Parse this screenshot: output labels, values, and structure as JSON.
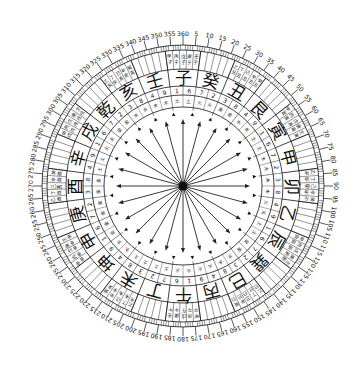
{
  "diagram": {
    "center": [
      183,
      186
    ],
    "colors": {
      "ink": "#111111",
      "background": "#ffffff"
    },
    "radii": {
      "degree_labels": 153,
      "tick_outer": 141,
      "tick_inner": 136,
      "sub_outer": 136,
      "sub_inner": 117,
      "mtn_outer": 117,
      "mtn_inner": 100,
      "num_outer": 100,
      "num_inner": 91,
      "elem_outer": 91,
      "elem_inner": 79,
      "tri_ring": 72,
      "arrow_len": 64
    },
    "degree_step": 5,
    "mountains": [
      "子",
      "癸",
      "丑",
      "艮",
      "寅",
      "甲",
      "卯",
      "乙",
      "辰",
      "巽",
      "巳",
      "丙",
      "午",
      "丁",
      "未",
      "坤",
      "申",
      "庚",
      "酉",
      "辛",
      "戌",
      "乾",
      "亥",
      "壬"
    ],
    "branches": [
      "子",
      "丑",
      "寅",
      "卯",
      "辰",
      "巳",
      "午",
      "未",
      "申",
      "酉",
      "戌",
      "亥"
    ],
    "yang_stems": [
      "甲",
      "丙",
      "戊",
      "庚",
      "壬"
    ],
    "yin_stems": [
      "乙",
      "丁",
      "己",
      "辛",
      "癸"
    ],
    "inner_numbers": [
      "1",
      "6",
      "7",
      "2",
      "3",
      "8",
      "4",
      "9",
      "1",
      "6",
      "7",
      "2",
      "3",
      "8",
      "4",
      "9",
      "1",
      "6",
      "7",
      "2",
      "3",
      "8",
      "4",
      "9",
      "1",
      "6",
      "7",
      "2",
      "3",
      "8",
      "4",
      "9",
      "1",
      "6",
      "7",
      "2",
      "3",
      "8",
      "4",
      "9",
      "1",
      "6",
      "7",
      "2",
      "3",
      "8",
      "4",
      "9"
    ],
    "elements": [
      "土",
      "火",
      "金",
      "水",
      "土",
      "木",
      "木",
      "火",
      "土",
      "金",
      "水",
      "火",
      "火",
      "土",
      "土",
      "水",
      "金",
      "金",
      "金",
      "土",
      "火",
      "金",
      "水",
      "木"
    ],
    "arrow_count": 24
  }
}
